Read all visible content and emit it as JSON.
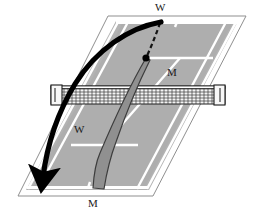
{
  "figure": {
    "type": "tennis-court-perspective-diagram",
    "title": "",
    "background_color": "#ffffff"
  },
  "court": {
    "surface_color": "#b3b3b3",
    "line_color": "#ffffff",
    "outline_color": "#8c8c8c",
    "inner_shade_color": "#a8a8a8",
    "perspective": "parallelogram-skewed"
  },
  "net": {
    "mesh_color": "#2b2b2b",
    "band_color": "#f2f2f2",
    "post_label": "net-post"
  },
  "labels": [
    {
      "id": "top-w",
      "text": "W",
      "position": "top-baseline-outside"
    },
    {
      "id": "mid-m",
      "text": "M",
      "position": "far-court-right"
    },
    {
      "id": "mid-w",
      "text": "W",
      "position": "near-court-left"
    },
    {
      "id": "bottom-m",
      "text": "M",
      "position": "bottom-baseline-outside"
    }
  ],
  "annotations": {
    "ball_trajectory": {
      "name": "black-curved-arrow",
      "color": "#000000",
      "style": "thick solid curve with arrowhead",
      "from": "far baseline near W",
      "to": "near court left sideline"
    },
    "player_path": {
      "name": "gray-tapered-line",
      "color": "#8f8f8f",
      "outline_color": "#3d3d3d",
      "style": "tapered solid band"
    },
    "dashed_segment": {
      "name": "dashed-trajectory",
      "color": "#1a1a1a",
      "style": "dashed line with ball marker"
    },
    "ball_marker": {
      "name": "ball-dot",
      "color": "#000000",
      "radius_px": 3.5
    }
  }
}
